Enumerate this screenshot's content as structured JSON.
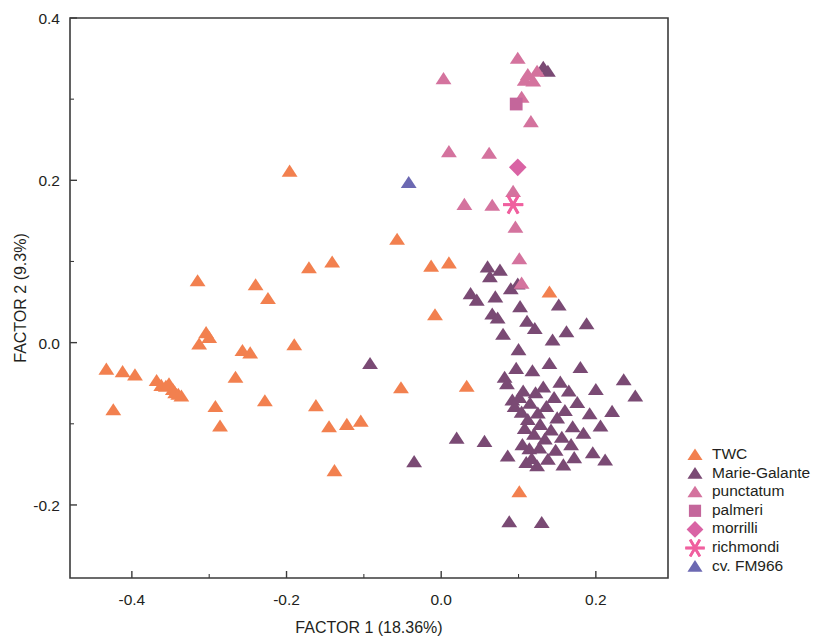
{
  "chart_data": {
    "type": "scatter",
    "title": "",
    "xlabel": "FACTOR 1 (18.36%)",
    "ylabel": "FACTOR 2 (9.3%)",
    "xlim": [
      -0.48,
      0.2933
    ],
    "ylim": [
      -0.29,
      0.4
    ],
    "xticks": [
      -0.4,
      -0.2,
      0.0,
      0.2
    ],
    "xtick_labels": [
      "-0.4",
      "-0.2",
      "0.0",
      "0.2"
    ],
    "xminor_ticks": [
      -0.3,
      -0.1,
      0.1
    ],
    "yticks": [
      -0.2,
      0.0,
      0.2,
      0.4
    ],
    "ytick_labels": [
      "-0.2",
      "0.0",
      "0.2",
      "0.4"
    ],
    "yminor_ticks": [
      -0.1,
      0.1,
      0.3
    ],
    "grid": false,
    "legend_position": "right",
    "series": [
      {
        "name": "TWC",
        "color": "#F2804F",
        "marker": "triangle",
        "points": [
          [
            -0.433,
            -0.033
          ],
          [
            -0.424,
            -0.083
          ],
          [
            -0.412,
            -0.036
          ],
          [
            -0.396,
            -0.04
          ],
          [
            -0.368,
            -0.047
          ],
          [
            -0.362,
            -0.053
          ],
          [
            -0.356,
            -0.054
          ],
          [
            -0.352,
            -0.051
          ],
          [
            -0.347,
            -0.058
          ],
          [
            -0.344,
            -0.062
          ],
          [
            -0.34,
            -0.064
          ],
          [
            -0.336,
            -0.066
          ],
          [
            -0.315,
            0.076
          ],
          [
            -0.313,
            -0.002
          ],
          [
            -0.304,
            0.012
          ],
          [
            -0.3,
            0.006
          ],
          [
            -0.292,
            -0.079
          ],
          [
            -0.286,
            -0.103
          ],
          [
            -0.266,
            -0.043
          ],
          [
            -0.257,
            -0.01
          ],
          [
            -0.247,
            -0.013
          ],
          [
            -0.24,
            0.071
          ],
          [
            -0.228,
            -0.072
          ],
          [
            -0.224,
            0.054
          ],
          [
            -0.196,
            0.211
          ],
          [
            -0.19,
            -0.003
          ],
          [
            -0.171,
            0.092
          ],
          [
            -0.162,
            -0.078
          ],
          [
            -0.145,
            -0.104
          ],
          [
            -0.141,
            0.099
          ],
          [
            -0.138,
            -0.158
          ],
          [
            -0.122,
            -0.101
          ],
          [
            -0.104,
            -0.097
          ],
          [
            -0.057,
            0.127
          ],
          [
            -0.052,
            -0.056
          ],
          [
            -0.013,
            0.094
          ],
          [
            -0.008,
            0.034
          ],
          [
            0.01,
            0.098
          ],
          [
            0.033,
            -0.054
          ],
          [
            0.101,
            -0.184
          ],
          [
            0.14,
            0.062
          ]
        ]
      },
      {
        "name": "Marie-Galante",
        "color": "#7A4A74",
        "marker": "triangle",
        "points": [
          [
            -0.092,
            -0.026
          ],
          [
            -0.035,
            -0.147
          ],
          [
            0.02,
            -0.118
          ],
          [
            0.038,
            0.06
          ],
          [
            0.046,
            0.052
          ],
          [
            0.056,
            -0.122
          ],
          [
            0.06,
            0.093
          ],
          [
            0.063,
            0.081
          ],
          [
            0.066,
            0.035
          ],
          [
            0.07,
            0.056
          ],
          [
            0.073,
            0.03
          ],
          [
            0.076,
            0.089
          ],
          [
            0.08,
            0.01
          ],
          [
            0.082,
            -0.043
          ],
          [
            0.085,
            -0.051
          ],
          [
            0.086,
            -0.14
          ],
          [
            0.088,
            -0.221
          ],
          [
            0.09,
            0.066
          ],
          [
            0.092,
            -0.071
          ],
          [
            0.095,
            -0.079
          ],
          [
            0.097,
            -0.032
          ],
          [
            0.099,
            0.072
          ],
          [
            0.1,
            -0.009
          ],
          [
            0.101,
            -0.068
          ],
          [
            0.102,
            0.044
          ],
          [
            0.104,
            -0.086
          ],
          [
            0.105,
            -0.126
          ],
          [
            0.106,
            -0.06
          ],
          [
            0.108,
            -0.106
          ],
          [
            0.11,
            -0.148
          ],
          [
            0.111,
            0.026
          ],
          [
            0.112,
            -0.095
          ],
          [
            0.114,
            -0.131
          ],
          [
            0.115,
            -0.075
          ],
          [
            0.117,
            -0.143
          ],
          [
            0.118,
            -0.035
          ],
          [
            0.12,
            -0.113
          ],
          [
            0.121,
            0.017
          ],
          [
            0.122,
            -0.062
          ],
          [
            0.124,
            -0.152
          ],
          [
            0.125,
            -0.087
          ],
          [
            0.127,
            -0.13
          ],
          [
            0.128,
            -0.101
          ],
          [
            0.13,
            -0.222
          ],
          [
            0.132,
            -0.055
          ],
          [
            0.134,
            -0.119
          ],
          [
            0.136,
            -0.079
          ],
          [
            0.138,
            -0.144
          ],
          [
            0.14,
            -0.026
          ],
          [
            0.142,
            -0.108
          ],
          [
            0.144,
            0.003
          ],
          [
            0.146,
            -0.068
          ],
          [
            0.148,
            -0.133
          ],
          [
            0.15,
            -0.093
          ],
          [
            0.152,
            0.046
          ],
          [
            0.154,
            -0.049
          ],
          [
            0.156,
            -0.117
          ],
          [
            0.158,
            -0.151
          ],
          [
            0.16,
            -0.084
          ],
          [
            0.162,
            0.013
          ],
          [
            0.165,
            -0.06
          ],
          [
            0.168,
            -0.126
          ],
          [
            0.17,
            -0.104
          ],
          [
            0.172,
            -0.142
          ],
          [
            0.176,
            -0.074
          ],
          [
            0.18,
            -0.031
          ],
          [
            0.184,
            -0.112
          ],
          [
            0.188,
            0.023
          ],
          [
            0.192,
            -0.088
          ],
          [
            0.196,
            -0.136
          ],
          [
            0.2,
            -0.058
          ],
          [
            0.206,
            -0.103
          ],
          [
            0.212,
            -0.145
          ],
          [
            0.221,
            -0.085
          ],
          [
            0.236,
            -0.046
          ],
          [
            0.251,
            -0.066
          ],
          [
            0.132,
            0.339
          ],
          [
            0.138,
            0.334
          ]
        ]
      },
      {
        "name": "punctatum",
        "color": "#D4739E",
        "marker": "triangle",
        "points": [
          [
            0.003,
            0.325
          ],
          [
            0.01,
            0.235
          ],
          [
            0.062,
            0.233
          ],
          [
            0.099,
            0.35
          ],
          [
            0.104,
            0.302
          ],
          [
            0.108,
            0.323
          ],
          [
            0.112,
            0.33
          ],
          [
            0.116,
            0.272
          ],
          [
            0.119,
            0.322
          ],
          [
            0.124,
            0.334
          ],
          [
            0.093,
            0.186
          ],
          [
            0.096,
            0.142
          ],
          [
            0.03,
            0.17
          ],
          [
            0.066,
            0.169
          ],
          [
            0.101,
            0.103
          ],
          [
            0.104,
            0.073
          ]
        ]
      },
      {
        "name": "palmeri",
        "color": "#C4669B",
        "marker": "square",
        "points": [
          [
            0.097,
            0.294
          ]
        ]
      },
      {
        "name": "morrilli",
        "color": "#D963A4",
        "marker": "diamond",
        "points": [
          [
            0.099,
            0.216
          ]
        ]
      },
      {
        "name": "richmondi",
        "color": "#F0609F",
        "marker": "asterisk",
        "points": [
          [
            0.093,
            0.17
          ]
        ]
      },
      {
        "name": "cv. FM966",
        "color": "#6C69B2",
        "marker": "triangle",
        "points": [
          [
            -0.042,
            0.197
          ]
        ]
      }
    ]
  },
  "legend": {
    "entries": [
      {
        "label": "TWC"
      },
      {
        "label": "Marie-Galante"
      },
      {
        "label": "punctatum"
      },
      {
        "label": "palmeri"
      },
      {
        "label": "morrilli"
      },
      {
        "label": "richmondi"
      },
      {
        "label": "cv. FM966"
      }
    ]
  }
}
